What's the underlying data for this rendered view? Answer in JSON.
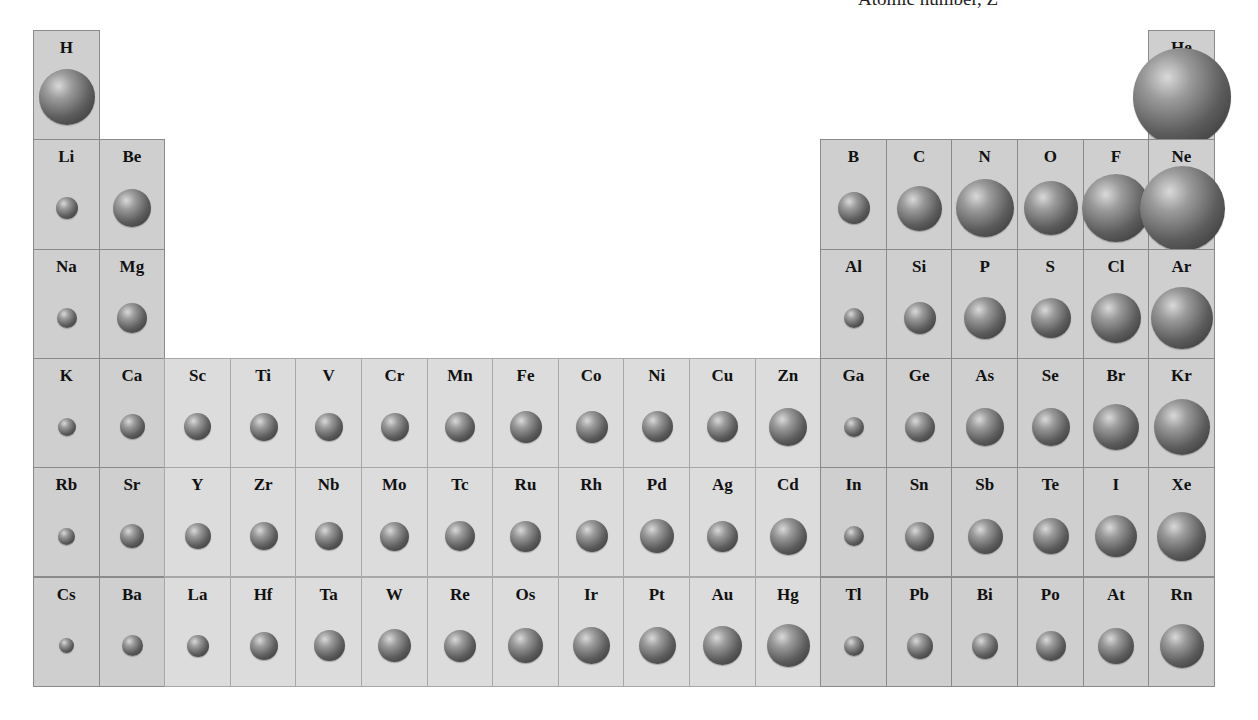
{
  "title": "Atomic number, Z",
  "colors": {
    "main_block": "#cfcfcf",
    "transition_block": "#dcdcdc",
    "border": "#8a8a8a"
  },
  "layout": {
    "left": 33,
    "top": 30,
    "col_w": 65.6,
    "row_h": 109.3
  },
  "elements": [
    {
      "sym": "H",
      "col": 1,
      "row": 1,
      "d": 56
    },
    {
      "sym": "He",
      "col": 18,
      "row": 1,
      "d": 98
    },
    {
      "sym": "Li",
      "col": 1,
      "row": 2,
      "d": 22
    },
    {
      "sym": "Be",
      "col": 2,
      "row": 2,
      "d": 38
    },
    {
      "sym": "B",
      "col": 13,
      "row": 2,
      "d": 32
    },
    {
      "sym": "C",
      "col": 14,
      "row": 2,
      "d": 45
    },
    {
      "sym": "N",
      "col": 15,
      "row": 2,
      "d": 58
    },
    {
      "sym": "O",
      "col": 16,
      "row": 2,
      "d": 54
    },
    {
      "sym": "F",
      "col": 17,
      "row": 2,
      "d": 68
    },
    {
      "sym": "Ne",
      "col": 18,
      "row": 2,
      "d": 85
    },
    {
      "sym": "Na",
      "col": 1,
      "row": 3,
      "d": 20
    },
    {
      "sym": "Mg",
      "col": 2,
      "row": 3,
      "d": 30
    },
    {
      "sym": "Al",
      "col": 13,
      "row": 3,
      "d": 20
    },
    {
      "sym": "Si",
      "col": 14,
      "row": 3,
      "d": 32
    },
    {
      "sym": "P",
      "col": 15,
      "row": 3,
      "d": 42
    },
    {
      "sym": "S",
      "col": 16,
      "row": 3,
      "d": 40
    },
    {
      "sym": "Cl",
      "col": 17,
      "row": 3,
      "d": 50
    },
    {
      "sym": "Ar",
      "col": 18,
      "row": 3,
      "d": 62
    },
    {
      "sym": "K",
      "col": 1,
      "row": 4,
      "d": 18
    },
    {
      "sym": "Ca",
      "col": 2,
      "row": 4,
      "d": 25
    },
    {
      "sym": "Sc",
      "col": 3,
      "row": 4,
      "d": 27
    },
    {
      "sym": "Ti",
      "col": 4,
      "row": 4,
      "d": 28
    },
    {
      "sym": "V",
      "col": 5,
      "row": 4,
      "d": 28
    },
    {
      "sym": "Cr",
      "col": 6,
      "row": 4,
      "d": 28
    },
    {
      "sym": "Mn",
      "col": 7,
      "row": 4,
      "d": 30
    },
    {
      "sym": "Fe",
      "col": 8,
      "row": 4,
      "d": 32
    },
    {
      "sym": "Co",
      "col": 9,
      "row": 4,
      "d": 32
    },
    {
      "sym": "Ni",
      "col": 10,
      "row": 4,
      "d": 31
    },
    {
      "sym": "Cu",
      "col": 11,
      "row": 4,
      "d": 31
    },
    {
      "sym": "Zn",
      "col": 12,
      "row": 4,
      "d": 38
    },
    {
      "sym": "Ga",
      "col": 13,
      "row": 4,
      "d": 20
    },
    {
      "sym": "Ge",
      "col": 14,
      "row": 4,
      "d": 30
    },
    {
      "sym": "As",
      "col": 15,
      "row": 4,
      "d": 38
    },
    {
      "sym": "Se",
      "col": 16,
      "row": 4,
      "d": 38
    },
    {
      "sym": "Br",
      "col": 17,
      "row": 4,
      "d": 46
    },
    {
      "sym": "Kr",
      "col": 18,
      "row": 4,
      "d": 56
    },
    {
      "sym": "Rb",
      "col": 1,
      "row": 5,
      "d": 17
    },
    {
      "sym": "Sr",
      "col": 2,
      "row": 5,
      "d": 24
    },
    {
      "sym": "Y",
      "col": 3,
      "row": 5,
      "d": 26
    },
    {
      "sym": "Zr",
      "col": 4,
      "row": 5,
      "d": 28
    },
    {
      "sym": "Nb",
      "col": 5,
      "row": 5,
      "d": 28
    },
    {
      "sym": "Mo",
      "col": 6,
      "row": 5,
      "d": 29
    },
    {
      "sym": "Tc",
      "col": 7,
      "row": 5,
      "d": 30
    },
    {
      "sym": "Ru",
      "col": 8,
      "row": 5,
      "d": 31
    },
    {
      "sym": "Rh",
      "col": 9,
      "row": 5,
      "d": 32
    },
    {
      "sym": "Pd",
      "col": 10,
      "row": 5,
      "d": 34
    },
    {
      "sym": "Ag",
      "col": 11,
      "row": 5,
      "d": 31
    },
    {
      "sym": "Cd",
      "col": 12,
      "row": 5,
      "d": 37
    },
    {
      "sym": "In",
      "col": 13,
      "row": 5,
      "d": 20
    },
    {
      "sym": "Sn",
      "col": 14,
      "row": 5,
      "d": 29
    },
    {
      "sym": "Sb",
      "col": 15,
      "row": 5,
      "d": 35
    },
    {
      "sym": "Te",
      "col": 16,
      "row": 5,
      "d": 36
    },
    {
      "sym": "I",
      "col": 17,
      "row": 5,
      "d": 42
    },
    {
      "sym": "Xe",
      "col": 18,
      "row": 5,
      "d": 49
    },
    {
      "sym": "Cs",
      "col": 1,
      "row": 6,
      "d": 15
    },
    {
      "sym": "Ba",
      "col": 2,
      "row": 6,
      "d": 21
    },
    {
      "sym": "La",
      "col": 3,
      "row": 6,
      "d": 22
    },
    {
      "sym": "Hf",
      "col": 4,
      "row": 6,
      "d": 28
    },
    {
      "sym": "Ta",
      "col": 5,
      "row": 6,
      "d": 31
    },
    {
      "sym": "W",
      "col": 6,
      "row": 6,
      "d": 33
    },
    {
      "sym": "Re",
      "col": 7,
      "row": 6,
      "d": 32
    },
    {
      "sym": "Os",
      "col": 8,
      "row": 6,
      "d": 35
    },
    {
      "sym": "Ir",
      "col": 9,
      "row": 6,
      "d": 37
    },
    {
      "sym": "Pt",
      "col": 10,
      "row": 6,
      "d": 37
    },
    {
      "sym": "Au",
      "col": 11,
      "row": 6,
      "d": 39
    },
    {
      "sym": "Hg",
      "col": 12,
      "row": 6,
      "d": 43
    },
    {
      "sym": "Tl",
      "col": 13,
      "row": 6,
      "d": 20
    },
    {
      "sym": "Pb",
      "col": 14,
      "row": 6,
      "d": 26
    },
    {
      "sym": "Bi",
      "col": 15,
      "row": 6,
      "d": 26
    },
    {
      "sym": "Po",
      "col": 16,
      "row": 6,
      "d": 30
    },
    {
      "sym": "At",
      "col": 17,
      "row": 6,
      "d": 36
    },
    {
      "sym": "Rn",
      "col": 18,
      "row": 6,
      "d": 44
    }
  ]
}
